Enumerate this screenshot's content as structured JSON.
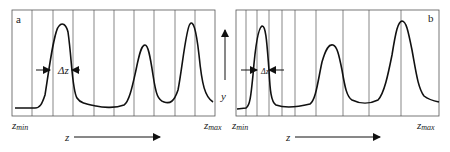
{
  "panels": [
    {
      "id": "a",
      "label": "a",
      "delta_label": "Δz",
      "zmin_label": "z",
      "zmin_sub": "min",
      "zmax_label": "z",
      "zmax_sub": "max",
      "axis_label": "z",
      "frame": {
        "x": 12,
        "y": 10,
        "w": 203,
        "h": 106
      },
      "gridlines_x": [
        32,
        53,
        73,
        94,
        114,
        134,
        154,
        175,
        195
      ],
      "curve": "M15,108 L35,108 C40,108 42,104 45,95 C49,70 54,30 59,26 C62,22 66,24 68,32 C72,60 72,90 77,98 C80,103 86,104 96,106 C104,108 116,108 124,105 C129,102 132,88 136,70 C140,50 142,45 145,45 C148,45 150,55 153,75 C156,95 158,100 164,102 C170,104 174,102 178,90 C182,70 186,28 190,24 C193,20 196,28 199,55 C202,85 205,97 213,102",
      "delta_arrow": {
        "y": 70,
        "left_x": 36,
        "right_x": 80,
        "inner_left": 50,
        "inner_right": 72,
        "text_x": 58
      }
    },
    {
      "id": "b",
      "label": "b",
      "delta_label": "Δz",
      "zmin_label": "z",
      "zmin_sub": "min",
      "zmax_label": "z",
      "zmax_sub": "max",
      "axis_label": "z",
      "frame": {
        "x": 236,
        "y": 10,
        "w": 203,
        "h": 106
      },
      "gridlines_x": [
        246,
        257,
        269,
        282,
        295,
        316,
        343,
        369,
        401
      ],
      "curve": "M237,109 L246,108 C250,106 251,95 253,75 C255,50 258,28 262,26 C266,25 267,45 269,70 C270,90 271,102 276,105 C284,108 298,107 310,104 C316,100 318,80 322,62 C326,48 329,44 333,45 C337,46 339,55 342,70 C345,88 347,97 352,100 C360,104 370,104 378,100 C384,94 388,75 392,55 C396,30 398,22 402,21 C406,21 408,30 412,50 C416,72 418,88 424,96 C429,100 434,101 439,102",
      "delta_arrow": {
        "y": 70,
        "left_x": 241,
        "right_x": 284,
        "inner_left": 257,
        "inner_right": 269,
        "text_x": 261
      }
    }
  ],
  "y_axis": {
    "label": "y",
    "x": 221,
    "top": 30,
    "bottom": 97
  },
  "colors": {
    "curve": "#111111",
    "grid": "#555555",
    "frame": "#555555",
    "text": "#222222"
  }
}
